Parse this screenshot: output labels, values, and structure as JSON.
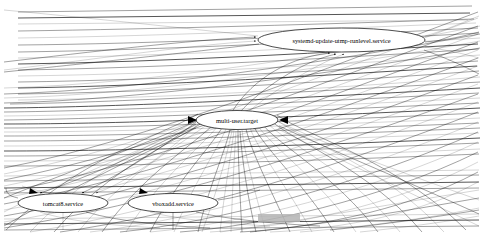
{
  "canvas": {
    "width": 481,
    "height": 240,
    "background": "#ffffff",
    "ink": "#000000",
    "artifact_color": "#b4b4b4"
  },
  "graph": {
    "title": "systemd dependency graph",
    "type": "directed-dependency-graph",
    "renderer": "graphviz-dot",
    "node_shape": "ellipse",
    "edge_style": "curved-spline-with-arrowhead",
    "description": "Dense systemd unit dependency graph; hundreds of thin edges converge on multi-user.target"
  },
  "nodes": [
    {
      "id": "systemd-update-utmp-runlevel",
      "label": "systemd-update-utmp-runlevel.service",
      "cx": 341.5,
      "cy": 40,
      "rx": 83.5,
      "ry": 12,
      "font_size": 6.4
    },
    {
      "id": "multi-user-target",
      "label": "multi-user.target",
      "cx": 237,
      "cy": 120,
      "rx": 41,
      "ry": 9.5,
      "font_size": 6.4
    },
    {
      "id": "tomcat8",
      "label": "tomcat8.service",
      "cx": 63,
      "cy": 203,
      "rx": 45,
      "ry": 9.5,
      "font_size": 6.4
    },
    {
      "id": "vboxadd",
      "label": "vboxadd.service",
      "cx": 173,
      "cy": 203,
      "rx": 45,
      "ry": 9.5,
      "font_size": 6.4
    }
  ],
  "artifacts": [
    {
      "name": "gray-block",
      "x": 258,
      "y": 214,
      "width": 42,
      "height": 8,
      "color": "#b4b4b4"
    }
  ],
  "edge_bundles": [
    {
      "name": "upper-left-horizontal-fan",
      "count": 34,
      "description": "near-horizontal lines sweeping from left edge toward multi-user.target"
    },
    {
      "name": "upper-right-fan",
      "count": 26,
      "description": "lines fanning to the right edge past systemd-update-utmp-runlevel.service"
    },
    {
      "name": "lower-radial-fan",
      "count": 30,
      "description": "curved edges radiating downward from multi-user.target"
    },
    {
      "name": "bottom-crossing-bundle",
      "count": 28,
      "description": "long shallow diagonals crossing the bottom region"
    }
  ]
}
